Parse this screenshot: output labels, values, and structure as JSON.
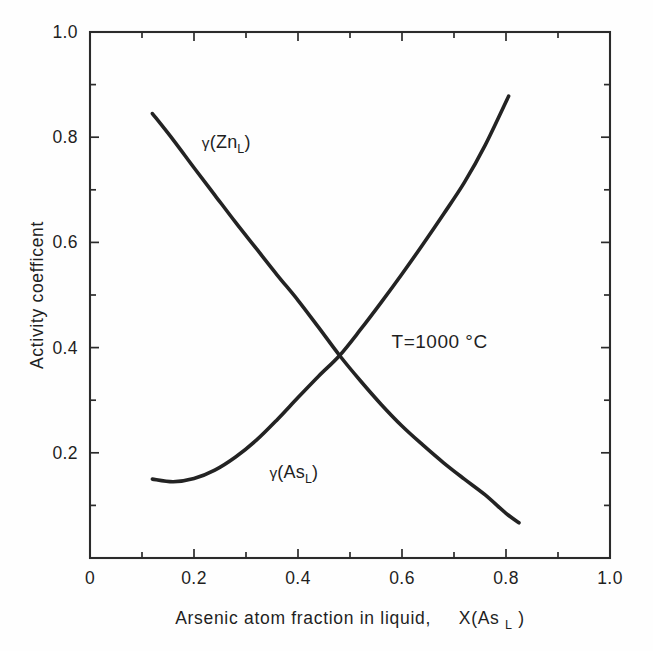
{
  "chart_data": {
    "type": "line",
    "title": "",
    "xlabel": "Arsenic atom fraction in liquid,   X(Asₗ)",
    "ylabel": "Activity coefficent",
    "xlim": [
      0,
      1
    ],
    "ylim": [
      0,
      1
    ],
    "grid": false,
    "legend_position": "inline-annotations",
    "x_major_ticks": [
      0,
      0.2,
      0.4,
      0.6,
      0.8,
      1.0
    ],
    "x_tick_labels": [
      "0",
      "0.2",
      "0.4",
      "0.6",
      "0.8",
      "1.0"
    ],
    "x_minor_ticks": [
      0.1,
      0.3,
      0.5,
      0.7,
      0.9
    ],
    "y_major_ticks": [
      0.2,
      0.4,
      0.6,
      0.8,
      1.0
    ],
    "y_tick_labels": [
      "0.2",
      "0.4",
      "0.6",
      "0.8",
      "1.0"
    ],
    "y_minor_ticks": [
      0.1,
      0.3,
      0.5,
      0.7,
      0.9
    ],
    "annotations": [
      {
        "text": "T=1000 °C",
        "x": 0.58,
        "y": 0.4
      }
    ],
    "series": [
      {
        "name": "γ(Znₗ)",
        "label_base": "(Zn",
        "label_sub": "L",
        "label_tail": ")",
        "label_x": 0.215,
        "label_y": 0.78,
        "color": "#232323",
        "x": [
          0.12,
          0.16,
          0.2,
          0.24,
          0.28,
          0.32,
          0.36,
          0.4,
          0.44,
          0.48,
          0.52,
          0.56,
          0.6,
          0.64,
          0.68,
          0.72,
          0.76,
          0.8,
          0.825
        ],
        "y": [
          0.845,
          0.795,
          0.742,
          0.69,
          0.638,
          0.588,
          0.538,
          0.49,
          0.438,
          0.385,
          0.337,
          0.292,
          0.251,
          0.215,
          0.181,
          0.15,
          0.12,
          0.085,
          0.067
        ]
      },
      {
        "name": "γ(Asₗ)",
        "label_base": "(As",
        "label_sub": "L",
        "label_tail": ")",
        "label_x": 0.345,
        "label_y": 0.152,
        "color": "#232323",
        "x": [
          0.12,
          0.16,
          0.2,
          0.24,
          0.28,
          0.32,
          0.36,
          0.4,
          0.44,
          0.48,
          0.52,
          0.56,
          0.6,
          0.64,
          0.68,
          0.72,
          0.76,
          0.805
        ],
        "y": [
          0.15,
          0.145,
          0.151,
          0.167,
          0.192,
          0.224,
          0.263,
          0.305,
          0.346,
          0.385,
          0.434,
          0.486,
          0.54,
          0.596,
          0.654,
          0.714,
          0.785,
          0.878
        ]
      }
    ]
  },
  "axes": {
    "x_title": "Arsenic atom fraction in liquid,",
    "x_title_symbol_base": "X(As",
    "x_title_symbol_sub": "L",
    "x_title_symbol_tail": ")",
    "y_title": "Activity coefficent"
  },
  "colors": {
    "curve": "#232323",
    "axis": "#2b2b2b",
    "text": "#1f1f1f",
    "background": "#fefefe"
  }
}
